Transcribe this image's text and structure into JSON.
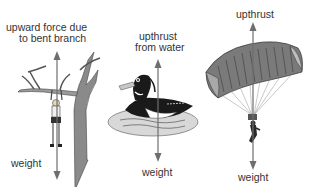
{
  "diagram": {
    "panels": [
      {
        "id": "branch",
        "subject": "person hanging from tree branch",
        "up_label_line1": "upward force due",
        "up_label_line2": "to bent branch",
        "down_label": "weight"
      },
      {
        "id": "duck",
        "subject": "duck floating on water",
        "up_label_line1": "upthrust",
        "up_label_line2": "from water",
        "down_label": "weight"
      },
      {
        "id": "parachute",
        "subject": "parachutist under canopy",
        "up_label_line1": "upthrust",
        "down_label": "weight"
      }
    ],
    "colors": {
      "arrow": "#6e6e6e",
      "text": "#333333",
      "tree": "#8a8a8a",
      "water": "#bdbdbd",
      "canopy": "#7a7a7a"
    }
  }
}
